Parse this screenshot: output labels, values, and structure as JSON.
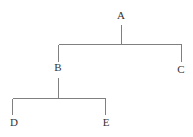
{
  "diagram": {
    "type": "tree",
    "title": "",
    "background_color": "#ffffff",
    "line_color": "#808080",
    "line_width": 1,
    "label_color": "#333333",
    "label_font_size": 11,
    "width": 193,
    "height": 137,
    "nodes": [
      {
        "id": "A",
        "label": "A",
        "x": 121,
        "y": 16,
        "depth": 0,
        "parent": null
      },
      {
        "id": "B",
        "label": "B",
        "x": 58,
        "y": 68,
        "depth": 1,
        "parent": "A"
      },
      {
        "id": "C",
        "label": "C",
        "x": 181,
        "y": 70,
        "depth": 1,
        "parent": "A"
      },
      {
        "id": "D",
        "label": "D",
        "x": 14,
        "y": 123,
        "depth": 2,
        "parent": "B"
      },
      {
        "id": "E",
        "label": "E",
        "x": 106,
        "y": 123,
        "depth": 2,
        "parent": "B"
      }
    ],
    "edges": [
      {
        "from": "A",
        "to": "B",
        "style": "elbow"
      },
      {
        "from": "A",
        "to": "C",
        "style": "elbow"
      },
      {
        "from": "B",
        "to": "D",
        "style": "elbow"
      },
      {
        "from": "B",
        "to": "E",
        "style": "elbow"
      }
    ],
    "connector_bars": [
      {
        "id": "bar-a",
        "parent": "A",
        "y": 44,
        "x_start": 58,
        "x_end": 181,
        "stem_x": 121,
        "stem_top": 25,
        "children_drop_bottom": [
          62,
          62
        ]
      },
      {
        "id": "bar-b",
        "parent": "B",
        "y": 98,
        "x_start": 12,
        "x_end": 105,
        "stem_x": 58,
        "stem_top": 78,
        "children_drop_bottom": [
          115,
          115
        ]
      }
    ]
  }
}
